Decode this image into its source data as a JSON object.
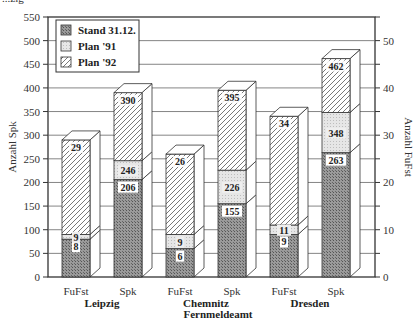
{
  "header": {
    "cut_title": "...zig"
  },
  "chart_data": {
    "type": "bar",
    "stacked": true,
    "style": "3d-stacked-column",
    "title": "",
    "xlabel": "Fernmeldeamt",
    "ylabel": "Anzahl Spk",
    "ylabel_right": "Anzahl FuFst",
    "ylim": [
      0,
      550
    ],
    "ylim_right": [
      0,
      55
    ],
    "yticks": [
      0,
      50,
      100,
      150,
      200,
      250,
      300,
      350,
      400,
      450,
      500,
      550
    ],
    "yticks_right": [
      0,
      10,
      20,
      30,
      40,
      50
    ],
    "grid": true,
    "legend_position": "top-left inside",
    "legend": [
      "Stand 31.12.",
      "Plan '91",
      "Plan '92"
    ],
    "groups": [
      "Leipzig",
      "Chemnitz",
      "Dresden"
    ],
    "categories": [
      "FuFst",
      "Spk",
      "FuFst",
      "Spk",
      "FuFst",
      "Spk"
    ],
    "axis": [
      "right",
      "left",
      "right",
      "left",
      "right",
      "left"
    ],
    "series": [
      {
        "name": "Stand 31.12.",
        "values": [
          8,
          206,
          6,
          155,
          9,
          263
        ]
      },
      {
        "name": "Plan '91",
        "values": [
          9,
          246,
          9,
          226,
          11,
          348
        ]
      },
      {
        "name": "Plan '92",
        "values": [
          29,
          390,
          26,
          395,
          34,
          462
        ]
      }
    ],
    "note": "Values are cumulative levels per bar; FuFst bars read on right axis (0-55), Spk bars on left axis (0-550)."
  },
  "labels": {
    "ylabel_left": "Anzahl Spk",
    "ylabel_right": "Anzahl FuFst",
    "xlabel": "Fernmeldeamt",
    "legend": [
      "Stand 31.12.",
      "Plan '91",
      "Plan '92"
    ],
    "cat": [
      "FuFst",
      "Spk",
      "FuFst",
      "Spk",
      "FuFst",
      "Spk"
    ],
    "groups": [
      "Leipzig",
      "Chemnitz",
      "Dresden"
    ]
  },
  "colors": {
    "stand": "#8c8c8c",
    "plan91": "#e2e2e2",
    "plan92": "#ffffff",
    "frame": "#333333",
    "grid": "#555555"
  }
}
